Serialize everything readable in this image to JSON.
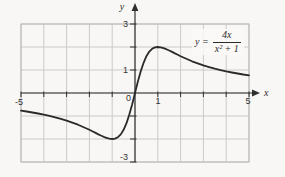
{
  "figure": {
    "equation": {
      "lhs": "y =",
      "numerator": "4x",
      "denominator": "x² + 1"
    },
    "axis_letters": {
      "x": "x",
      "y": "y"
    },
    "colors": {
      "background": "#f8f7f5",
      "grid": "#cacaca",
      "grid_border": "#b9b9b9",
      "axis": "#2f2f2f",
      "curve": "#2a2a2a",
      "text": "#333333"
    }
  },
  "chart_data": {
    "type": "line",
    "xlabel": "x",
    "ylabel": "y",
    "xlim": [
      -5,
      5
    ],
    "ylim": [
      -3,
      3
    ],
    "grid": true,
    "grid_step_x": 1,
    "grid_step_y": 1,
    "annotation": "y = 4x / (x² + 1)",
    "x_tick_labels": [
      {
        "value": -5,
        "label": "-5"
      },
      {
        "value": 0,
        "label": "0"
      },
      {
        "value": 1,
        "label": "1"
      },
      {
        "value": 5,
        "label": "5"
      }
    ],
    "y_tick_labels": [
      {
        "value": 3,
        "label": "3"
      },
      {
        "value": 1,
        "label": "1"
      },
      {
        "value": -3,
        "label": "-3"
      }
    ],
    "series": [
      {
        "name": "y = 4x/(x² + 1)",
        "x": [
          -5,
          -4.75,
          -4.5,
          -4.25,
          -4,
          -3.75,
          -3.5,
          -3.25,
          -3,
          -2.75,
          -2.5,
          -2.25,
          -2,
          -1.875,
          -1.75,
          -1.625,
          -1.5,
          -1.375,
          -1.25,
          -1.125,
          -1,
          -0.875,
          -0.75,
          -0.625,
          -0.5,
          -0.375,
          -0.25,
          -0.125,
          0,
          0.125,
          0.25,
          0.375,
          0.5,
          0.625,
          0.75,
          0.875,
          1,
          1.125,
          1.25,
          1.375,
          1.5,
          1.625,
          1.75,
          1.875,
          2,
          2.25,
          2.5,
          2.75,
          3,
          3.25,
          3.5,
          3.75,
          4,
          4.25,
          4.5,
          4.75,
          5
        ],
        "y": [
          -0.769,
          -0.806,
          -0.847,
          -0.892,
          -0.941,
          -0.996,
          -1.057,
          -1.124,
          -1.2,
          -1.285,
          -1.379,
          -1.485,
          -1.6,
          -1.661,
          -1.723,
          -1.785,
          -1.846,
          -1.903,
          -1.951,
          -1.986,
          -2,
          -1.982,
          -1.92,
          -1.798,
          -1.6,
          -1.315,
          -0.941,
          -0.492,
          0,
          0.492,
          0.941,
          1.315,
          1.6,
          1.798,
          1.92,
          1.982,
          2,
          1.986,
          1.951,
          1.903,
          1.846,
          1.785,
          1.723,
          1.661,
          1.6,
          1.485,
          1.379,
          1.285,
          1.2,
          1.124,
          1.057,
          0.996,
          0.941,
          0.892,
          0.847,
          0.806,
          0.769
        ]
      }
    ]
  }
}
